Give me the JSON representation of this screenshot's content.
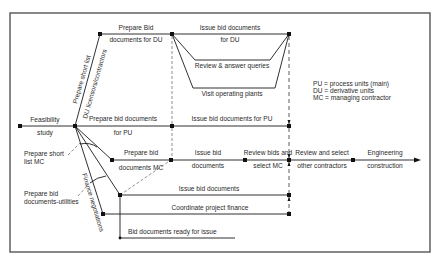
{
  "diagram": {
    "legend": [
      "PU = process units (main)",
      "DU = derivative units",
      "MC = managing contractor"
    ],
    "activities": {
      "feasibility_1": "Feasibility",
      "feasibility_2": "study",
      "prep_bid_du_1": "Prepare Bid",
      "prep_bid_du_2": "documents for DU",
      "issue_bid_du_1": "Issue bid documents",
      "issue_bid_du_2": "for DU",
      "review_queries": "Review & answer queries",
      "visit_plants": "Visit operating plants",
      "short_list_du_1": "Prepare short list",
      "short_list_du_2": "DU licensors/contractors",
      "prep_bid_pu_1": "Prepare bid documents",
      "prep_bid_pu_2": "for PU",
      "issue_bid_pu": "Issue bid documents for PU",
      "short_list_mc_1": "Prepare short",
      "short_list_mc_2": "list MC",
      "prep_bid_mc_1": "Prepare bid",
      "prep_bid_mc_2": "documents MC",
      "issue_bid_mc_1": "Issue bid",
      "issue_bid_mc_2": "documents",
      "review_bids_1": "Review bids and",
      "review_bids_2": "select MC",
      "review_select_1": "Review and select",
      "review_select_2": "other contractors",
      "engineering_1": "Engineering",
      "engineering_2": "construction",
      "prep_bid_util_1": "Prepare bid",
      "prep_bid_util_2": "documents-utilities",
      "finance_negotiations": "Finance negotiations",
      "issue_bid_util": "Issue bid documents",
      "coordinate_finance": "Coordinate project finance",
      "bid_docs_ready": "Bid documents ready for issue"
    }
  }
}
